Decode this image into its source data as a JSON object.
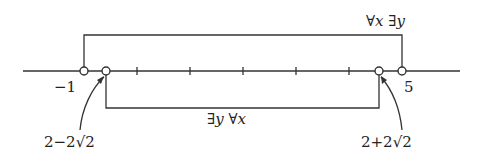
{
  "diagram": {
    "type": "number-line",
    "points": [
      {
        "label": "-1",
        "value": -1,
        "open": true
      },
      {
        "label": "2-2√2",
        "value": -0.828,
        "open": true
      },
      {
        "label": "2+2√2",
        "value": 4.828,
        "open": true
      },
      {
        "label": "5",
        "value": 5,
        "open": true
      }
    ],
    "top_bracket": {
      "from": "-1",
      "to": "5",
      "label": "∀x ∃y"
    },
    "bottom_bracket": {
      "from": "2-2√2",
      "to": "2+2√2",
      "label": "∃y ∀x"
    },
    "tick_count": 5
  },
  "labels": {
    "minus_one": "−1",
    "five": "5",
    "lower_root": "2−2√2",
    "upper_root": "2+2√2",
    "top_quant": "∀x  ∃y",
    "bottom_quant": "∃y ∀x"
  },
  "colors": {
    "ink": "#222222",
    "background": "#ffffff"
  }
}
